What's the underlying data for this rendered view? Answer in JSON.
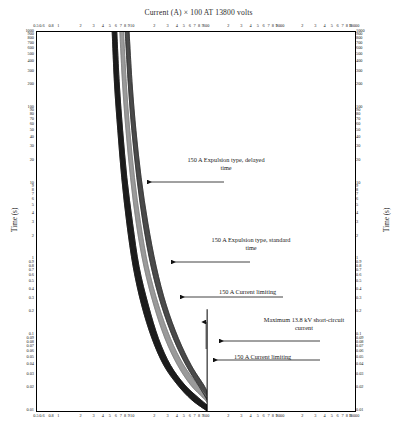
{
  "titles": {
    "top": "Current (A) × 100 AT 13800 volts",
    "bottom": "Current (A) × 100 AT 13800 volts",
    "y_left": "Time (s)",
    "y_right": "Time (s)"
  },
  "annotations": [
    {
      "id": "expulsion-delayed",
      "text": "150 A Expulsion type, delayed\ntime"
    },
    {
      "id": "expulsion-standard",
      "text": "150 A Expulsion type, standard\ntime"
    },
    {
      "id": "current-limiting-1",
      "text": "150 A Current limiting"
    },
    {
      "id": "max-short-circuit",
      "text": "Maximum 13.8 kV short-circuit\ncurrent"
    },
    {
      "id": "current-limiting-2",
      "text": "150 A Current limiting"
    }
  ],
  "chart_data": {
    "type": "line",
    "title": "Current (A) × 100 AT 13800 volts",
    "xlabel": "Current (A) × 100 AT 13800 volts",
    "ylabel": "Time (s)",
    "xscale": "log",
    "yscale": "log",
    "xlim": [
      0.5,
      10000
    ],
    "ylim": [
      0.01,
      1000
    ],
    "grid": false,
    "legend": "none",
    "xticklabels": [
      "0.5",
      "0.6",
      "0.8",
      "1",
      "2",
      "3",
      "4",
      "5",
      "6",
      "7",
      "8",
      "9",
      "10",
      "2",
      "3",
      "4",
      "5",
      "6",
      "7",
      "8",
      "9",
      "100",
      "2",
      "3",
      "4",
      "5",
      "6",
      "7",
      "8",
      "9",
      "1000",
      "2",
      "3",
      "4",
      "5",
      "6",
      "7",
      "8",
      "9",
      "10000"
    ],
    "yticklabels": [
      "1000",
      "900",
      "800",
      "700",
      "600",
      "500",
      "400",
      "300",
      "200",
      "100",
      "90",
      "80",
      "70",
      "60",
      "50",
      "40",
      "30",
      "20",
      "10",
      "9",
      "8",
      "7",
      "6",
      "5",
      "4",
      "3",
      "2",
      "1",
      "0.9",
      "0.8",
      "0.7",
      "0.6",
      "0.5",
      "0.4",
      "0.3",
      "0.2",
      "0.1",
      "0.09",
      "0.08",
      "0.07",
      "0.06",
      "0.05",
      "0.04",
      "0.03",
      "0.02",
      "0.01"
    ],
    "annotations": [
      {
        "label": "150 A Expulsion type, delayed time",
        "x": 6.0,
        "y": 9.0
      },
      {
        "label": "150 A Expulsion type, standard time",
        "x": 8.0,
        "y": 0.75
      },
      {
        "label": "150 A Current limiting",
        "x": 18.0,
        "y": 0.25
      },
      {
        "label": "Maximum 13.8 kV short-circuit current",
        "x": 100.0,
        "y": 0.085
      },
      {
        "label": "150 A Current limiting",
        "x": 45.0,
        "y": 0.04
      }
    ],
    "series": [
      {
        "name": "150 A Expulsion type, delayed time (min)",
        "x": [
          5.2,
          5.6,
          6.2,
          7.0,
          8.2,
          10.0,
          13.0,
          18.0,
          26.0,
          40.0,
          62.0,
          100.0
        ],
        "y": [
          1000,
          200,
          50,
          12,
          3.0,
          0.8,
          0.25,
          0.09,
          0.04,
          0.022,
          0.014,
          0.01
        ]
      },
      {
        "name": "150 A Expulsion type, delayed time (max)",
        "x": [
          6.0,
          6.5,
          7.2,
          8.2,
          9.8,
          12.0,
          16.0,
          22.0,
          32.0,
          50.0,
          76.0,
          100.0
        ],
        "y": [
          1000,
          200,
          50,
          12,
          3.0,
          0.8,
          0.25,
          0.09,
          0.04,
          0.022,
          0.015,
          0.012
        ]
      },
      {
        "name": "150 A Expulsion type, standard time (min)",
        "x": [
          6.6,
          7.2,
          8.0,
          9.2,
          11.0,
          14.0,
          19.0,
          27.0,
          40.0,
          60.0,
          88.0,
          100.0
        ],
        "y": [
          1000,
          200,
          50,
          12,
          3.0,
          0.8,
          0.25,
          0.09,
          0.04,
          0.022,
          0.015,
          0.013
        ]
      },
      {
        "name": "150 A Expulsion type, standard time (max)",
        "x": [
          7.4,
          8.1,
          9.0,
          10.4,
          12.6,
          16.0,
          22.0,
          32.0,
          47.0,
          70.0,
          96.0,
          100.0
        ],
        "y": [
          1000,
          200,
          50,
          12,
          3.0,
          0.8,
          0.25,
          0.09,
          0.042,
          0.024,
          0.016,
          0.015
        ]
      },
      {
        "name": "150 A Current limiting (min)",
        "x": [
          7.8,
          8.6,
          9.6,
          11.2,
          13.6,
          17.5,
          24.0,
          35.0,
          52.0,
          78.0,
          100.0
        ],
        "y": [
          1000,
          200,
          50,
          12,
          3.0,
          0.8,
          0.25,
          0.09,
          0.04,
          0.021,
          0.014
        ]
      },
      {
        "name": "150 A Current limiting (max)",
        "x": [
          8.8,
          9.7,
          10.9,
          12.8,
          15.8,
          20.5,
          28.0,
          41.0,
          61.0,
          90.0,
          100.0
        ],
        "y": [
          1000,
          200,
          50,
          12,
          3.0,
          0.8,
          0.25,
          0.09,
          0.04,
          0.022,
          0.018
        ]
      },
      {
        "name": "Maximum 13.8 kV short-circuit current",
        "x": [
          100.0,
          100.0
        ],
        "y": [
          0.01,
          0.22
        ]
      }
    ]
  },
  "colors": {
    "band_dark": "#1c1c1c",
    "band_mid": "#4a4a4a",
    "band_light": "#9a9a9a",
    "band_pale": "#c8c8c8",
    "axis": "#000000",
    "text": "#1a1a1a"
  }
}
